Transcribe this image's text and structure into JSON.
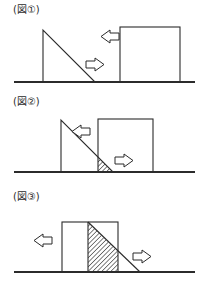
{
  "page": {
    "background_color": "#ffffff",
    "ink_color": "#2b2b2b",
    "width": 202,
    "height": 293
  },
  "figures": [
    {
      "id": "figure-1",
      "label": "(図①)",
      "description": "直角三角形の斜面と離れた四角いブロック、互いに近づく向きの矢印",
      "ground": {
        "x1": 14,
        "y1": 82,
        "x2": 195,
        "y2": 82
      },
      "wedge": {
        "name": "incline-wedge",
        "points": "43,30 43,82 95,82",
        "fill": "none",
        "hatched": false
      },
      "block": {
        "name": "block",
        "x": 120,
        "y": 27,
        "width": 60,
        "height": 55,
        "fill": "none",
        "hatched": false
      },
      "arrows": [
        {
          "name": "arrow-right-wedge",
          "direction": "right",
          "x": 86,
          "y": 58,
          "width": 19,
          "height": 13
        },
        {
          "name": "arrow-left-block",
          "direction": "left",
          "x": 100,
          "y": 30,
          "width": 19,
          "height": 13
        }
      ],
      "overlap": null
    },
    {
      "id": "figure-2",
      "label": "(図②)",
      "description": "ブロックが斜面の下端に接触し、わずかに重なった斜線部がある",
      "ground": {
        "x1": 14,
        "y1": 80,
        "x2": 195,
        "y2": 80
      },
      "wedge": {
        "name": "incline-wedge",
        "points": "61,28 61,80 113,80",
        "fill": "none",
        "hatched": false
      },
      "block": {
        "name": "block",
        "x": 98,
        "y": 27,
        "width": 55,
        "height": 53,
        "fill": "none",
        "hatched": false
      },
      "arrows": [
        {
          "name": "arrow-left-wedge",
          "direction": "left",
          "x": 71,
          "y": 33,
          "width": 19,
          "height": 13
        },
        {
          "name": "arrow-right-block",
          "direction": "right",
          "x": 115,
          "y": 62,
          "width": 19,
          "height": 13
        }
      ],
      "overlap": {
        "name": "overlap-hatched-region",
        "points": "98,65 113,80 98,80",
        "hatched": true
      }
    },
    {
      "id": "figure-3",
      "label": "(図③)",
      "description": "ブロックと斜面が大きく重なり、広い斜線部ができている",
      "ground": {
        "x1": 14,
        "y1": 85,
        "x2": 195,
        "y2": 85
      },
      "wedge": {
        "name": "incline-wedge",
        "points": "88,35 88,85 140,85",
        "fill": "none",
        "hatched": false
      },
      "block": {
        "name": "block",
        "x": 62,
        "y": 35,
        "width": 56,
        "height": 50,
        "fill": "none",
        "hatched": false
      },
      "arrows": [
        {
          "name": "arrow-left-block",
          "direction": "left",
          "x": 33,
          "y": 47,
          "width": 19,
          "height": 13
        },
        {
          "name": "arrow-right-wedge",
          "direction": "right",
          "x": 133,
          "y": 63,
          "width": 19,
          "height": 13
        }
      ],
      "overlap": {
        "name": "overlap-hatched-region",
        "points": "88,35 118,65 118,85 88,85",
        "hatched": true
      }
    }
  ]
}
